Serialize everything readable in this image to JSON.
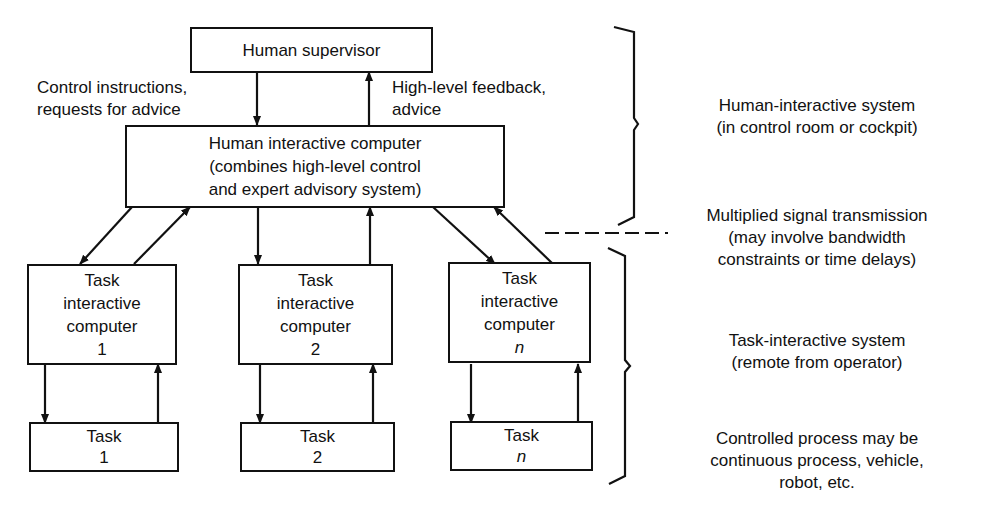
{
  "diagram": {
    "supervisor": {
      "label": "Human supervisor"
    },
    "left_arrow_label": [
      "Control instructions,",
      "requests for advice"
    ],
    "right_arrow_label": [
      "High-level feedback,",
      "advice"
    ],
    "hic": {
      "lines": [
        "Human interactive computer",
        "(combines high-level control",
        "and expert advisory system)"
      ]
    },
    "tics": [
      {
        "lines": [
          "Task",
          "interactive",
          "computer"
        ],
        "index": "1"
      },
      {
        "lines": [
          "Task",
          "interactive",
          "computer"
        ],
        "index": "2"
      },
      {
        "lines": [
          "Task",
          "interactive",
          "computer"
        ],
        "index": "n"
      }
    ],
    "tasks": [
      {
        "label": "Task",
        "index": "1"
      },
      {
        "label": "Task",
        "index": "2"
      },
      {
        "label": "Task",
        "index": "n"
      }
    ],
    "annotations": {
      "human_interactive": [
        "Human-interactive system",
        "(in control room or cockpit)"
      ],
      "transmission": [
        "Multiplied signal transmission",
        "(may involve bandwidth",
        "constraints or time delays)"
      ],
      "task_interactive": [
        "Task-interactive system",
        "(remote from operator)"
      ],
      "controlled_process": [
        "Controlled process may be",
        "continuous process, vehicle,",
        "robot, etc."
      ]
    }
  }
}
